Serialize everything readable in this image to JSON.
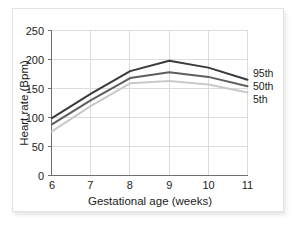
{
  "chart_data": {
    "type": "line",
    "title": "",
    "xlabel": "Gestational age (weeks)",
    "ylabel": "Heart rate (Bpm)",
    "x": [
      6,
      7,
      8,
      9,
      10,
      11
    ],
    "xticklabels": [
      "6",
      "7",
      "8",
      "9",
      "10",
      "11"
    ],
    "yticks": [
      0,
      50,
      100,
      150,
      200,
      250
    ],
    "yticklabels": [
      "0",
      "50",
      "100",
      "150",
      "200",
      "250"
    ],
    "xlim": [
      6,
      11
    ],
    "ylim": [
      0,
      250
    ],
    "grid": true,
    "legend_position": "right-inline-labels",
    "series": [
      {
        "name": "95th",
        "label": "95th",
        "color": "#3a3a3a",
        "values": [
          99,
          141,
          180,
          198,
          186,
          165
        ]
      },
      {
        "name": "50th",
        "label": "50th",
        "color": "#5e5e5e",
        "values": [
          88,
          130,
          168,
          178,
          170,
          154
        ]
      },
      {
        "name": "5th",
        "label": "5th",
        "color": "#c9c9c9",
        "values": [
          76,
          120,
          159,
          163,
          157,
          143
        ]
      }
    ]
  },
  "axes": {
    "y_tick_0": "0",
    "y_tick_50": "50",
    "y_tick_100": "100",
    "y_tick_150": "150",
    "y_tick_200": "200",
    "y_tick_250": "250",
    "x_tick_6": "6",
    "x_tick_7": "7",
    "x_tick_8": "8",
    "x_tick_9": "9",
    "x_tick_10": "10",
    "x_tick_11": "11",
    "x_title": "Gestational age (weeks)",
    "y_title": "Heart rate (Bpm)"
  },
  "legend": {
    "item_95th": "95th",
    "item_50th": "50th",
    "item_5th": "5th"
  },
  "colors": {
    "grid": "#dcdcdc",
    "axis": "#6e6e6e",
    "card_border": "#e2e2e2",
    "background": "#ffffff",
    "series_95th": "#3a3a3a",
    "series_50th": "#5e5e5e",
    "series_5th": "#c9c9c9"
  }
}
